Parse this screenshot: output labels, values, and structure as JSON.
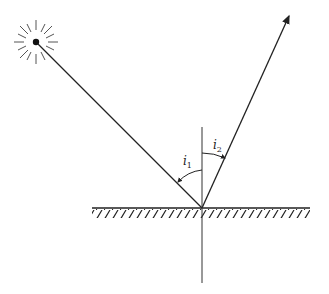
{
  "diagram": {
    "colors": {
      "line": "#222222",
      "background": "#ffffff"
    },
    "source": {
      "name": "light-source",
      "x": 36,
      "y": 42
    },
    "reflection_point": {
      "x": 202,
      "y": 208
    },
    "reflected_tip": {
      "x": 290,
      "y": 14
    },
    "surface": {
      "x1": 92,
      "x2": 310,
      "y": 208
    },
    "normal": {
      "x": 202,
      "y1": 127,
      "y2": 283
    },
    "labels": {
      "incidence": {
        "main": "i",
        "sub": "1"
      },
      "reflection": {
        "main": "i",
        "sub": "2"
      }
    }
  }
}
